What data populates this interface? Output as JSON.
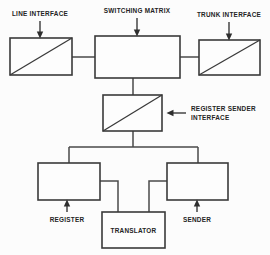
{
  "diagram": {
    "background_color": "#fcfcfc",
    "line_color": "#3a3a3a",
    "text_color": "#242424",
    "labels": {
      "line_interface": "LINE INTERFACE",
      "switching_matrix": "SWITCHING MATRIX",
      "trunk_interface": "TRUNK INTERFACE",
      "register_sender_interface_line1": "REGISTER SENDER",
      "register_sender_interface_line2": "INTERFACE",
      "register": "REGISTER",
      "translator": "TRANSLATOR",
      "sender": "SENDER"
    },
    "blocks": [
      {
        "id": "line-interface",
        "label": "LINE INTERFACE",
        "x": 10,
        "y": 38,
        "w": 62,
        "h": 37,
        "diagonal": true,
        "inner_label": false
      },
      {
        "id": "switching-matrix",
        "label": "SWITCHING MATRIX",
        "x": 95,
        "y": 36,
        "w": 85,
        "h": 42,
        "diagonal": false,
        "inner_label": false
      },
      {
        "id": "trunk-interface",
        "label": "TRUNK INTERFACE",
        "x": 199,
        "y": 40,
        "w": 61,
        "h": 35,
        "diagonal": true,
        "inner_label": false
      },
      {
        "id": "register-sender-interface",
        "label": "REGISTER SENDER INTERFACE",
        "x": 103,
        "y": 95,
        "w": 59,
        "h": 36,
        "diagonal": true,
        "inner_label": false
      },
      {
        "id": "register",
        "label": "REGISTER",
        "x": 38,
        "y": 163,
        "w": 62,
        "h": 37,
        "diagonal": false,
        "inner_label": false
      },
      {
        "id": "sender",
        "label": "SENDER",
        "x": 167,
        "y": 163,
        "w": 61,
        "h": 37,
        "diagonal": false,
        "inner_label": false
      },
      {
        "id": "translator",
        "label": "TRANSLATOR",
        "x": 102,
        "y": 212,
        "w": 63,
        "h": 36,
        "diagonal": false,
        "inner_label": true
      }
    ],
    "connections": [
      {
        "id": "line-to-matrix",
        "from": "line-interface",
        "to": "switching-matrix"
      },
      {
        "id": "matrix-to-trunk",
        "from": "switching-matrix",
        "to": "trunk-interface"
      },
      {
        "id": "matrix-to-rsi",
        "from": "switching-matrix",
        "to": "register-sender-interface"
      },
      {
        "id": "rsi-to-bus",
        "from": "register-sender-interface",
        "to": "bus"
      },
      {
        "id": "bus-to-register",
        "from": "bus",
        "to": "register"
      },
      {
        "id": "bus-to-sender",
        "from": "bus",
        "to": "sender"
      },
      {
        "id": "register-to-translator",
        "from": "register",
        "to": "translator"
      },
      {
        "id": "sender-to-translator",
        "from": "sender",
        "to": "translator"
      }
    ],
    "callouts": [
      {
        "id": "callout-line-interface",
        "label": "LINE INTERFACE",
        "direction": "down"
      },
      {
        "id": "callout-switching-matrix",
        "label": "SWITCHING MATRIX",
        "direction": "down"
      },
      {
        "id": "callout-trunk-interface",
        "label": "TRUNK INTERFACE",
        "direction": "down"
      },
      {
        "id": "callout-register-sender",
        "label": "REGISTER SENDER INTERFACE",
        "direction": "left"
      },
      {
        "id": "callout-register",
        "label": "REGISTER",
        "direction": "up"
      },
      {
        "id": "callout-sender",
        "label": "SENDER",
        "direction": "up"
      }
    ]
  }
}
